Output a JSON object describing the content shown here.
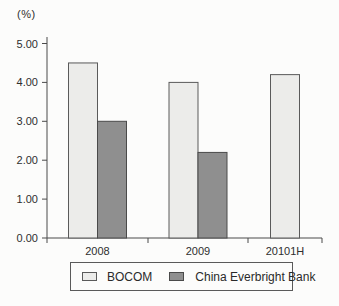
{
  "chart_data": {
    "type": "bar",
    "title": "",
    "xlabel": "",
    "ylabel": "(%)",
    "unit_label": "(%)",
    "categories": [
      "2008",
      "2009",
      "20101H"
    ],
    "series": [
      {
        "name": "BOCOM",
        "values": [
          4.5,
          4.0,
          4.2
        ],
        "fill": "#ececea",
        "stroke": "#5a5a5a"
      },
      {
        "name": "China Everbright Bank",
        "values": [
          3.0,
          2.2,
          null
        ],
        "fill": "#8f8f8f",
        "stroke": "#4a4a4a"
      }
    ],
    "ylim": [
      0,
      5
    ],
    "ytick_step": 1.0,
    "yticks": [
      "0.00",
      "1.00",
      "2.00",
      "3.00",
      "4.00",
      "5.00"
    ],
    "grid": false,
    "legend_position": "bottom",
    "axis_color": "#4a4a4a",
    "text_color": "#2e2e2e"
  }
}
